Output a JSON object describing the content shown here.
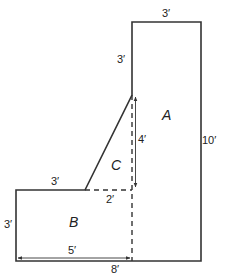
{
  "diagram": {
    "type": "composite-area-floor-plan",
    "stroke_color": "#333333",
    "regions": {
      "A": "A",
      "B": "B",
      "C": "C"
    },
    "dimensions": {
      "top_width": "3′",
      "upper_left_height": "3′",
      "right_height": "10′",
      "inner_height": "4′",
      "lower_top_width": "3′",
      "dashed_gap": "2′",
      "left_height": "3′",
      "inner_bottom_width": "5′",
      "bottom_width": "8′"
    }
  }
}
